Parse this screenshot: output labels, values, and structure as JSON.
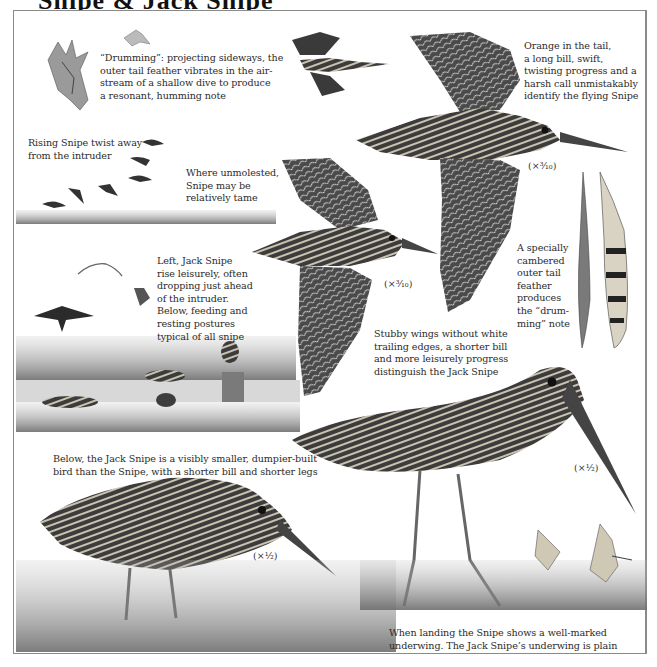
{
  "page": {
    "title_fragment": "Snipe & Jack Snipe",
    "colors": {
      "ink": "#2b2b2b",
      "frame": "#8a8a8a",
      "paper": "#ffffff"
    }
  },
  "captions": {
    "drumming": "“Drumming”: projecting sideways, the\nouter tail feather vibrates in the air-\nstream of a shallow dive to produce\na resonant, humming note",
    "flying_snipe": "Orange in the tail,\na long bill, swift,\ntwisting progress and a\nharsh call unmistakably\nidentify the flying Snipe",
    "rising_snipe": "Rising Snipe twist away\nfrom the intruder",
    "unmolested": "Where unmolested,\nSnipe may be\nrelatively tame",
    "jack_snipe_rise": "Left, Jack Snipe\nrise leisurely, often\ndropping just ahead\nof the intruder.\nBelow, feeding and\nresting postures\ntypical of all snipe",
    "tail_feather": "A specially\ncambered\nouter tail\nfeather\nproduces\nthe “drum-\nming” note",
    "stubby_wings": "Stubby wings without white\ntrailing edges, a shorter bill\nand more leisurely progress\ndistinguish the Jack Snipe",
    "size_comparison": "Below, the Jack Snipe is a visibly smaller, dumpier-built\nbird than the Snipe, with a shorter bill and shorter legs",
    "landing": "When landing the Snipe shows a well-marked\nunderwing. The Jack Snipe’s underwing is plain"
  },
  "scales": {
    "snipe_flight": "(×³⁄₁₀)",
    "jack_flight": "(×³⁄₁₀)",
    "jack_standing": "(×¹⁄₂)",
    "snipe_standing": "(×¹⁄₂)"
  },
  "illustrations": [
    {
      "name": "drumming-snipe",
      "subject": "Snipe diving with tail feathers spread"
    },
    {
      "name": "small-flying-snipe-top",
      "subject": "Snipe in flight"
    },
    {
      "name": "flying-snipe-large",
      "subject": "Common Snipe in flight"
    },
    {
      "name": "flying-jack-snipe",
      "subject": "Jack Snipe in flight"
    },
    {
      "name": "outer-tail-feathers",
      "subject": "Cambered outer tail feathers"
    },
    {
      "name": "rising-snipe-flock",
      "subject": "Snipe rising over marsh"
    },
    {
      "name": "jack-snipe-rising",
      "subject": "Jack Snipe rising"
    },
    {
      "name": "marsh-scene",
      "subject": "Snipe feeding and resting in marsh"
    },
    {
      "name": "jack-snipe-standing",
      "subject": "Jack Snipe standing"
    },
    {
      "name": "snipe-standing",
      "subject": "Common Snipe standing"
    },
    {
      "name": "landing-snipe",
      "subject": "Snipe landing"
    }
  ]
}
